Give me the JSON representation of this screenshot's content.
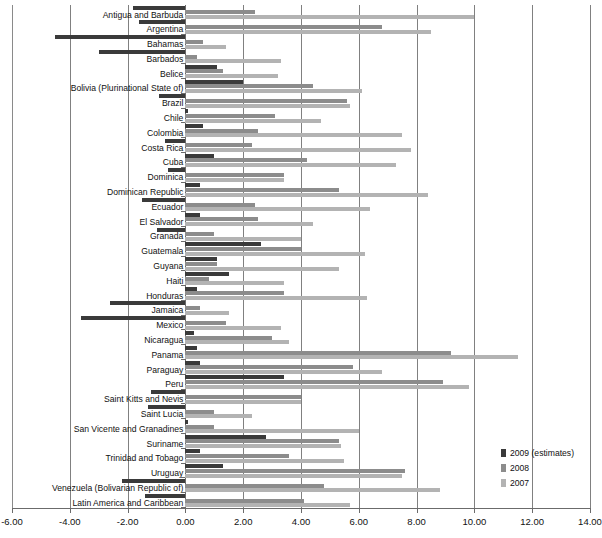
{
  "chart_data": {
    "type": "bar",
    "orientation": "horizontal",
    "title": "",
    "subtitle": "",
    "xlabel": "",
    "ylabel": "",
    "xlim": [
      -6.0,
      14.0
    ],
    "xticks": [
      "-6.00",
      "-4.00",
      "-2.00",
      "0.00",
      "2.00",
      "4.00",
      "6.00",
      "8.00",
      "10.00",
      "12.00",
      "14.00"
    ],
    "xtick_values": [
      -6,
      -4,
      -2,
      0,
      2,
      4,
      6,
      8,
      10,
      12,
      14
    ],
    "grid": "vertical",
    "legend_position": "bottom-right",
    "categories": [
      "Antigua and Barbuda",
      "Argentina",
      "Bahamas",
      "Barbados",
      "Belice",
      "Bolivia (Plurinational State of)",
      "Brazil",
      "Chile",
      "Colombia",
      "Costa Rica",
      "Cuba",
      "Dominica",
      "Dominican Republic",
      "Ecuador",
      "El Salvador",
      "Granada",
      "Guatemala",
      "Guyana",
      "Haiti",
      "Honduras",
      "Jamaica",
      "Mexico",
      "Nicaragua",
      "Panama",
      "Paraguay",
      "Peru",
      "Saint Kitts and Nevis",
      "Saint Lucia",
      "San Vicente and Granadines",
      "Suriname",
      "Trinidad and Tobago",
      "Uruguay",
      "Venezuela (Bolivarian Republic of)",
      "Latin America and Caribbean"
    ],
    "series": [
      {
        "name": "2009 (estimates)",
        "color": "#3a3a3a",
        "values": [
          -1.8,
          -1.6,
          -4.5,
          -3.0,
          1.1,
          2.0,
          -0.9,
          0.1,
          0.6,
          -0.7,
          1.0,
          -0.6,
          0.5,
          -1.5,
          0.5,
          -1.0,
          2.6,
          1.1,
          1.5,
          0.4,
          -2.6,
          -3.6,
          0.3,
          0.4,
          0.5,
          3.4,
          -1.2,
          -1.3,
          0.1,
          2.8,
          0.5,
          1.3,
          -2.2,
          -1.4
        ]
      },
      {
        "name": "2008",
        "color": "#8c8c8c",
        "values": [
          2.4,
          6.8,
          0.6,
          0.4,
          1.3,
          4.4,
          5.6,
          3.1,
          2.5,
          2.3,
          4.2,
          3.4,
          5.3,
          2.4,
          2.5,
          1.0,
          4.0,
          1.1,
          0.8,
          3.4,
          0.5,
          1.4,
          3.0,
          9.2,
          5.8,
          8.9,
          4.0,
          1.0,
          1.0,
          5.3,
          3.6,
          7.6,
          4.8,
          4.1
        ]
      },
      {
        "name": "2007",
        "color": "#b3b3b3",
        "values": [
          10.0,
          8.5,
          1.4,
          3.3,
          3.2,
          6.1,
          5.7,
          4.7,
          7.5,
          7.8,
          7.3,
          3.4,
          8.4,
          6.4,
          4.4,
          4.0,
          6.2,
          5.3,
          3.4,
          6.3,
          1.5,
          3.3,
          3.6,
          11.5,
          6.8,
          9.8,
          4.0,
          2.3,
          6.0,
          5.4,
          5.5,
          7.5,
          8.8,
          5.7
        ]
      }
    ]
  },
  "legend": {
    "items": [
      {
        "label": "2009 (estimates)",
        "color": "#3a3a3a"
      },
      {
        "label": "2008",
        "color": "#8c8c8c"
      },
      {
        "label": "2007",
        "color": "#b3b3b3"
      }
    ]
  },
  "colors": {
    "series_2009": "#3a3a3a",
    "series_2008": "#8c8c8c",
    "series_2007": "#b3b3b3",
    "grid": "#808080",
    "axis": "#6b6b6b",
    "background": "#ffffff",
    "text": "#111111"
  }
}
